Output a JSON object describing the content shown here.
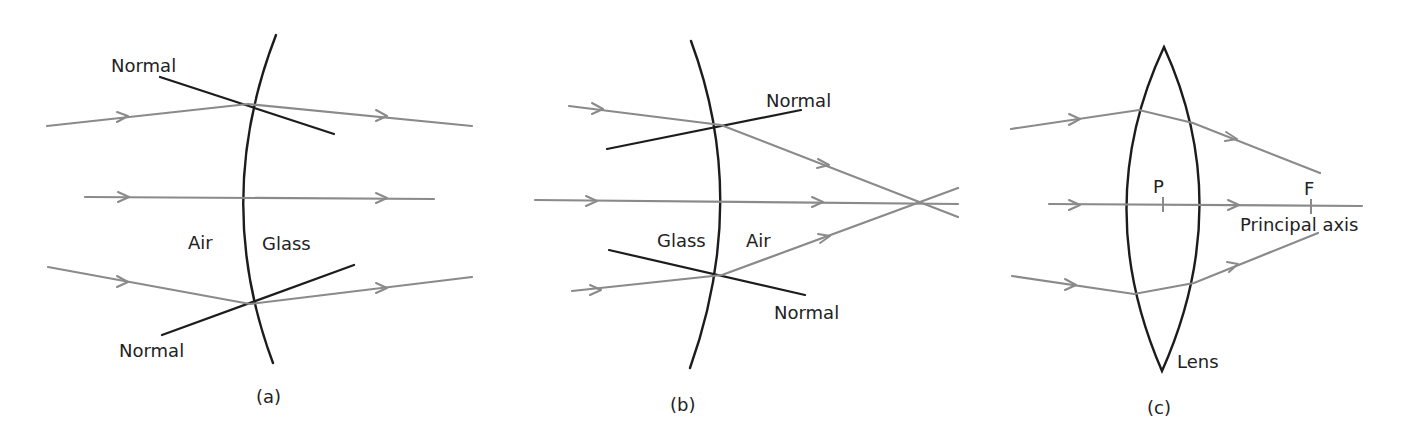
{
  "colors": {
    "background": "#ffffff",
    "ray": "#8a8a8a",
    "surface": "#1c1c1c",
    "text": "#222222"
  },
  "panel_a": {
    "caption": "(a)",
    "normal_top_label": "Normal",
    "normal_bottom_label": "Normal",
    "medium_left": "Air",
    "medium_right": "Glass"
  },
  "panel_b": {
    "caption": "(b)",
    "normal_top_label": "Normal",
    "normal_bottom_label": "Normal",
    "medium_left": "Glass",
    "medium_right": "Air"
  },
  "panel_c": {
    "caption": "(c)",
    "pole_label": "P",
    "focus_label": "F",
    "axis_label": "Principal axis",
    "lens_label": "Lens"
  }
}
